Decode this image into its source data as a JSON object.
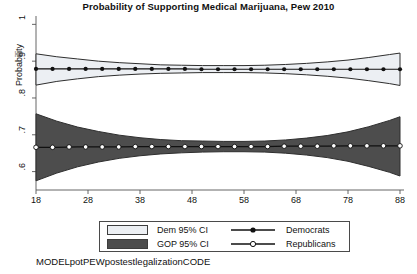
{
  "chart_data": {
    "type": "line",
    "title": "Probability of Supporting Medical Marijuana, Pew 2010",
    "xlabel": "",
    "ylabel": "Probability",
    "xlim": [
      18,
      88
    ],
    "ylim": [
      0.55,
      1.02
    ],
    "xticks": [
      "18",
      "28",
      "38",
      "48",
      "58",
      "68",
      "78",
      "88"
    ],
    "xtick_values": [
      18,
      28,
      38,
      48,
      58,
      68,
      78,
      88
    ],
    "yticks": [
      "1",
      ".9",
      ".8",
      ".7",
      ".6"
    ],
    "ytick_values": [
      1,
      0.9,
      0.8,
      0.7,
      0.6
    ],
    "grid": false,
    "legend_position": "below-plot",
    "caption": "MODELpotPEWpostestlegalizationCODE",
    "x": [
      18,
      22,
      26,
      30,
      34,
      38,
      42,
      46,
      50,
      54,
      58,
      62,
      66,
      70,
      74,
      78,
      82,
      86,
      88
    ],
    "series": [
      {
        "name": "Democrats",
        "marker": "filled-circle",
        "color": "#111111",
        "values": [
          0.879,
          0.879,
          0.879,
          0.879,
          0.879,
          0.879,
          0.879,
          0.879,
          0.878,
          0.878,
          0.878,
          0.878,
          0.878,
          0.878,
          0.878,
          0.878,
          0.878,
          0.878,
          0.878
        ],
        "ci_label": "Dem 95% CI",
        "ci_color": "#eceff3",
        "ci_lower": [
          0.835,
          0.845,
          0.852,
          0.858,
          0.862,
          0.865,
          0.867,
          0.868,
          0.869,
          0.869,
          0.869,
          0.868,
          0.866,
          0.863,
          0.859,
          0.854,
          0.847,
          0.839,
          0.834
        ],
        "ci_upper": [
          0.92,
          0.912,
          0.906,
          0.9,
          0.896,
          0.893,
          0.89,
          0.889,
          0.888,
          0.888,
          0.888,
          0.889,
          0.891,
          0.894,
          0.898,
          0.903,
          0.91,
          0.918,
          0.922
        ]
      },
      {
        "name": "Republicans",
        "marker": "hollow-circle",
        "color": "#111111",
        "values": [
          0.666,
          0.666,
          0.667,
          0.667,
          0.667,
          0.668,
          0.668,
          0.668,
          0.668,
          0.668,
          0.668,
          0.668,
          0.669,
          0.669,
          0.669,
          0.67,
          0.67,
          0.67,
          0.67
        ],
        "ci_label": "GOP 95% CI",
        "ci_color": "#4d4d4d",
        "ci_lower": [
          0.575,
          0.596,
          0.613,
          0.626,
          0.636,
          0.643,
          0.648,
          0.651,
          0.653,
          0.654,
          0.654,
          0.653,
          0.65,
          0.645,
          0.638,
          0.628,
          0.614,
          0.598,
          0.588
        ],
        "ci_upper": [
          0.757,
          0.737,
          0.721,
          0.709,
          0.699,
          0.692,
          0.687,
          0.684,
          0.683,
          0.682,
          0.682,
          0.683,
          0.686,
          0.691,
          0.698,
          0.708,
          0.722,
          0.739,
          0.749
        ]
      }
    ]
  },
  "legend": {
    "dem_ci_label": "Dem 95% CI",
    "gop_ci_label": "GOP 95% CI",
    "democrats_label": "Democrats",
    "republicans_label": "Republicans"
  },
  "caption": "MODELpotPEWpostestlegalizationCODE"
}
